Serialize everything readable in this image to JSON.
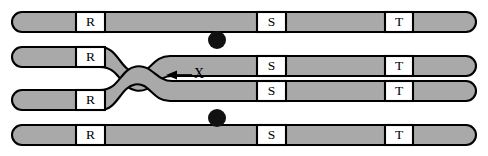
{
  "figure": {
    "background_color": "#ffffff",
    "width": 488,
    "height": 156,
    "colors": {
      "chromatid_fill": "#a9a9a9",
      "outline": "#000000",
      "band_fill": "#ffffff",
      "centromere": "#111111"
    }
  },
  "bands": {
    "labels": [
      "R",
      "S",
      "T"
    ],
    "r_label": "R",
    "s_label": "S",
    "t_label": "T"
  },
  "chromatids": [
    {
      "id": "chromatid-1",
      "row": 1,
      "crosses_over": false,
      "bands": [
        {
          "name": "R",
          "label": "R",
          "x": 76,
          "width": 29
        },
        {
          "name": "S",
          "label": "S",
          "x": 257,
          "width": 29
        },
        {
          "name": "T",
          "label": "T",
          "x": 385,
          "width": 28
        }
      ]
    },
    {
      "id": "chromatid-2",
      "row": 2,
      "crosses_over": true,
      "bands": [
        {
          "name": "R",
          "label": "R",
          "x": 76,
          "width": 29
        },
        {
          "name": "S",
          "label": "S",
          "x": 257,
          "width": 29
        },
        {
          "name": "T",
          "label": "T",
          "x": 385,
          "width": 28
        }
      ]
    },
    {
      "id": "chromatid-3",
      "row": 3,
      "crosses_over": true,
      "bands": [
        {
          "name": "R",
          "label": "R",
          "x": 76,
          "width": 29
        },
        {
          "name": "S",
          "label": "S",
          "x": 257,
          "width": 29
        },
        {
          "name": "T",
          "label": "T",
          "x": 385,
          "width": 28
        }
      ]
    },
    {
      "id": "chromatid-4",
      "row": 4,
      "crosses_over": false,
      "bands": [
        {
          "name": "R",
          "label": "R",
          "x": 76,
          "width": 29
        },
        {
          "name": "S",
          "label": "S",
          "x": 257,
          "width": 29
        },
        {
          "name": "T",
          "label": "T",
          "x": 385,
          "width": 28
        }
      ]
    }
  ],
  "centromeres": [
    {
      "name": "centromere-upper",
      "cx": 217,
      "cy": 40,
      "r": 9
    },
    {
      "name": "centromere-lower",
      "cx": 217,
      "cy": 118,
      "r": 9
    }
  ],
  "annotation": {
    "label": "X",
    "label_x": 198,
    "label_y": 74,
    "arrow_from_x": 192,
    "arrow_to_x": 168,
    "arrow_y": 75,
    "meaning": "chiasma crossover point"
  }
}
